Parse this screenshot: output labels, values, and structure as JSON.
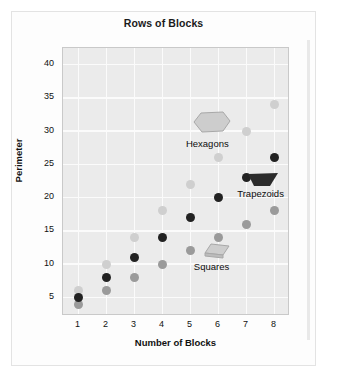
{
  "card": {
    "title": "Rows of Blocks"
  },
  "chart_data": {
    "type": "scatter",
    "title": "Rows of Blocks",
    "xlabel": "Number of Blocks",
    "ylabel": "Perimeter",
    "xlim": [
      0.45,
      8.55
    ],
    "ylim": [
      2.2,
      42.5
    ],
    "xticks": [
      1,
      2,
      3,
      4,
      5,
      6,
      7,
      8
    ],
    "yticks": [
      5,
      10,
      15,
      20,
      25,
      30,
      35,
      40
    ],
    "grid": true,
    "legend": "none",
    "annotations_position": "in-plot",
    "series": [
      {
        "name": "Trapezoids",
        "color": "#222222",
        "marker": "circle",
        "points": [
          {
            "x": 1,
            "y": 5
          },
          {
            "x": 2,
            "y": 8
          },
          {
            "x": 3,
            "y": 11
          },
          {
            "x": 4,
            "y": 14
          },
          {
            "x": 5,
            "y": 17
          },
          {
            "x": 6,
            "y": 20
          },
          {
            "x": 7,
            "y": 23
          },
          {
            "x": 8,
            "y": 26
          }
        ]
      },
      {
        "name": "Squares",
        "color": "#9a9a9a",
        "marker": "circle",
        "points": [
          {
            "x": 1,
            "y": 4
          },
          {
            "x": 2,
            "y": 6
          },
          {
            "x": 3,
            "y": 8
          },
          {
            "x": 4,
            "y": 10
          },
          {
            "x": 5,
            "y": 12
          },
          {
            "x": 6,
            "y": 14
          },
          {
            "x": 7,
            "y": 16
          },
          {
            "x": 8,
            "y": 18
          }
        ]
      },
      {
        "name": "Hexagons",
        "color": "#cfcfcf",
        "marker": "circle",
        "points": [
          {
            "x": 1,
            "y": 6
          },
          {
            "x": 2,
            "y": 10
          },
          {
            "x": 3,
            "y": 14
          },
          {
            "x": 4,
            "y": 18
          },
          {
            "x": 5,
            "y": 22
          },
          {
            "x": 6,
            "y": 26
          },
          {
            "x": 7,
            "y": 30
          },
          {
            "x": 8,
            "y": 34
          }
        ]
      }
    ],
    "annotations": [
      {
        "label": "Hexagons",
        "shape": "hexagon",
        "shape_color": "#cdcdcd",
        "x": 5.75,
        "y": 31.3,
        "label_x": 5.6,
        "label_y": 28.0
      },
      {
        "label": "Trapezoids",
        "shape": "trapezoid",
        "shape_color": "#2b2b2b",
        "x": 7.6,
        "y": 22.7,
        "label_x": 7.5,
        "label_y": 20.6
      },
      {
        "label": "Squares",
        "shape": "square3d",
        "shape_color": "#cdcdcd",
        "x": 5.95,
        "y": 11.9,
        "label_x": 5.75,
        "label_y": 9.6
      }
    ]
  }
}
